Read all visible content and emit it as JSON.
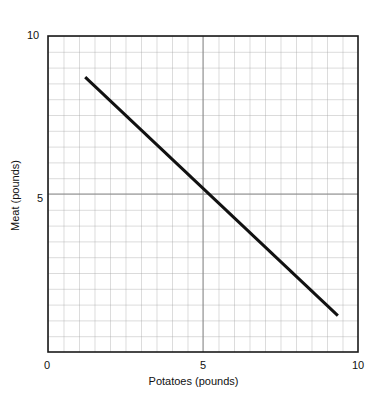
{
  "chart_data": {
    "type": "line",
    "title": "",
    "subtitle": "",
    "xlabel": "Potatoes (pounds)",
    "ylabel": "Meat (pounds)",
    "xlim": [
      0,
      10
    ],
    "ylim": [
      0,
      10
    ],
    "xticks": [
      0,
      5,
      10
    ],
    "yticks": [
      5,
      10
    ],
    "xtick_labels": [
      "0",
      "5",
      "10"
    ],
    "ytick_labels": [
      "5",
      "10"
    ],
    "grid": true,
    "grid_minor_step": 0.5,
    "grid_color": "#a6a6a6",
    "axis_color": "#1a1a1a",
    "background_color": "#ffffff",
    "legend": null,
    "legend_position": "none",
    "series": [
      {
        "name": "Budget constraint",
        "color": "#111111",
        "line_width": 3,
        "x": [
          1.2,
          9.35
        ],
        "y": [
          8.7,
          1.15
        ]
      }
    ],
    "annotations": [],
    "slope": -0.926,
    "intercept": 9.81
  },
  "ticks": {
    "y_top": "10",
    "y_mid": "5",
    "x_left": "0",
    "x_mid": "5",
    "x_right": "10"
  },
  "labels": {
    "x_axis_title": "Potatoes (pounds)",
    "y_axis_title": "Meat (pounds)"
  }
}
